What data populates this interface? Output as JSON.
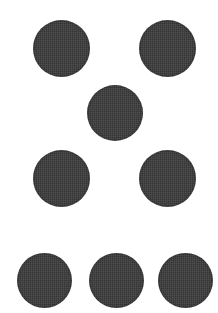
{
  "image": {
    "title": "Dot Pattern",
    "description": "Eight solid dark circles arranged on a plain white background",
    "width": 218,
    "height": 313,
    "background_color": "#ffffff",
    "dot_color": "#3b3b3b",
    "dot_count": 8
  },
  "groups": [
    {
      "name": "top-pair",
      "label": "Top row pair",
      "count": 2
    },
    {
      "name": "center-single",
      "label": "Center single dot",
      "count": 1
    },
    {
      "name": "middle-pair",
      "label": "Middle row pair",
      "count": 2
    },
    {
      "name": "bottom-triple",
      "label": "Bottom row triple",
      "count": 3
    }
  ],
  "dots": [
    {
      "id": "dot-1",
      "label": "Top left dot",
      "group": "top-pair",
      "x": 33,
      "y": 20,
      "size": 57
    },
    {
      "id": "dot-2",
      "label": "Top right dot",
      "group": "top-pair",
      "x": 139,
      "y": 20,
      "size": 57
    },
    {
      "id": "dot-3",
      "label": "Center dot",
      "group": "center-single",
      "x": 87,
      "y": 85,
      "size": 56
    },
    {
      "id": "dot-4",
      "label": "Middle left dot",
      "group": "middle-pair",
      "x": 33,
      "y": 150,
      "size": 57
    },
    {
      "id": "dot-5",
      "label": "Middle right dot",
      "group": "middle-pair",
      "x": 139,
      "y": 150,
      "size": 57
    },
    {
      "id": "dot-6",
      "label": "Bottom left dot",
      "group": "bottom-triple",
      "x": 17,
      "y": 253,
      "size": 55
    },
    {
      "id": "dot-7",
      "label": "Bottom center dot",
      "group": "bottom-triple",
      "x": 89,
      "y": 253,
      "size": 55
    },
    {
      "id": "dot-8",
      "label": "Bottom right dot",
      "group": "bottom-triple",
      "x": 158,
      "y": 253,
      "size": 55
    }
  ]
}
